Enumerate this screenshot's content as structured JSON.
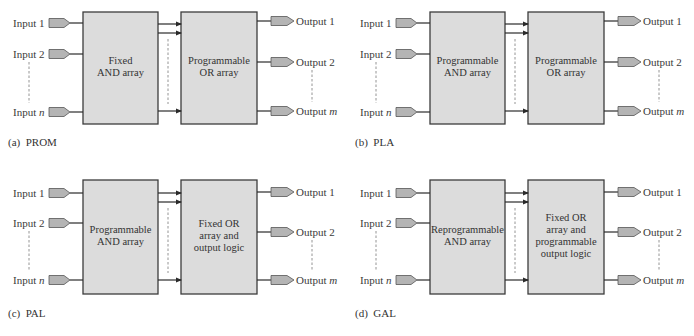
{
  "colors": {
    "box_fill": "#dcdcdc",
    "box_stroke": "#3c3c3c",
    "pin_fill": "#b4b4b4",
    "pin_stroke": "#555555",
    "line": "#2a2a2a",
    "dashed": "#888888"
  },
  "common": {
    "inputs": [
      "Input 1",
      "Input 2",
      "Input "
    ],
    "input_n_var": "n",
    "outputs": [
      "Output 1",
      "Output 2",
      "Output "
    ],
    "output_m_var": "m"
  },
  "panels": [
    {
      "id": "prom",
      "caption": "(a)  PROM",
      "left_box": [
        "Fixed",
        "AND array"
      ],
      "right_box": [
        "Programmable",
        "OR array"
      ]
    },
    {
      "id": "pla",
      "caption": "(b)  PLA",
      "left_box": [
        "Programmable",
        "AND array"
      ],
      "right_box": [
        "Programmable",
        "OR array"
      ]
    },
    {
      "id": "pal",
      "caption": "(c)  PAL",
      "left_box": [
        "Programmable",
        "AND array"
      ],
      "right_box": [
        "Fixed OR",
        "array and",
        "output logic"
      ]
    },
    {
      "id": "gal",
      "caption": "(d)  GAL",
      "left_box": [
        "Reprogrammable",
        "AND array"
      ],
      "right_box": [
        "Fixed OR",
        "array and",
        "programmable",
        "output logic"
      ]
    }
  ]
}
